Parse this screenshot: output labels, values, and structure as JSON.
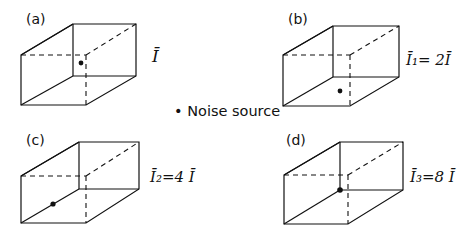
{
  "diagram": {
    "legend": {
      "marker": "•",
      "text": "Noise source"
    },
    "panels": [
      {
        "id": "a",
        "label": "(a)",
        "intensity_label": "Ī",
        "source_position": "center of room"
      },
      {
        "id": "b",
        "label": "(b)",
        "intensity_label": "Ī₁= 2Ī",
        "source_position": "on floor"
      },
      {
        "id": "c",
        "label": "(c)",
        "intensity_label": "Ī₂=4 Ī",
        "source_position": "on floor-wall edge"
      },
      {
        "id": "d",
        "label": "(d)",
        "intensity_label": "Ī₃=8 Ī",
        "source_position": "in corner"
      }
    ]
  }
}
